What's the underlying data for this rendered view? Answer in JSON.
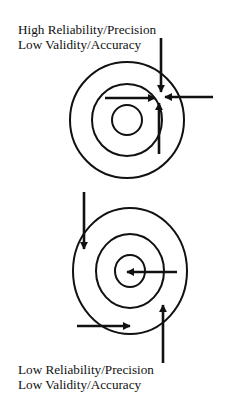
{
  "diagram": {
    "type": "target-analogy",
    "stroke_color": "#111111",
    "background": "#ffffff",
    "panels": [
      {
        "id": "top",
        "label_lines": [
          "High Reliability/Precision",
          "Low Validity/Accuracy"
        ],
        "reliability": "High",
        "validity": "Low",
        "target": {
          "cx": 127,
          "cy": 120,
          "rings": [
            {
              "rx": 57,
              "ry": 58
            },
            {
              "rx": 35,
              "ry": 36
            },
            {
              "rx": 15,
              "ry": 15
            }
          ]
        },
        "arrows": [
          {
            "from": [
              105,
              98
            ],
            "to": [
              155,
              98
            ],
            "direction": "right"
          },
          {
            "from": [
              161,
              38
            ],
            "to": [
              161,
              92
            ],
            "direction": "down"
          },
          {
            "from": [
              213,
              97
            ],
            "to": [
              165,
              97
            ],
            "direction": "left"
          },
          {
            "from": [
              159,
              154
            ],
            "to": [
              159,
              103
            ],
            "direction": "up"
          }
        ]
      },
      {
        "id": "bottom",
        "label_lines": [
          "Low Reliability/Precision",
          "Low Validity/Accuracy"
        ],
        "reliability": "Low",
        "validity": "Low",
        "target": {
          "cx": 130,
          "cy": 271,
          "rings": [
            {
              "rx": 57,
              "ry": 63
            },
            {
              "rx": 34,
              "ry": 37
            },
            {
              "rx": 15,
              "ry": 16
            }
          ]
        },
        "arrows": [
          {
            "from": [
              84,
              192
            ],
            "to": [
              84,
              249
            ],
            "direction": "down"
          },
          {
            "from": [
              177,
              272
            ],
            "to": [
              127,
              272
            ],
            "direction": "left"
          },
          {
            "from": [
              77,
              326
            ],
            "to": [
              130,
              326
            ],
            "direction": "right"
          },
          {
            "from": [
              163,
              363
            ],
            "to": [
              163,
              305
            ],
            "direction": "up"
          }
        ]
      }
    ]
  }
}
